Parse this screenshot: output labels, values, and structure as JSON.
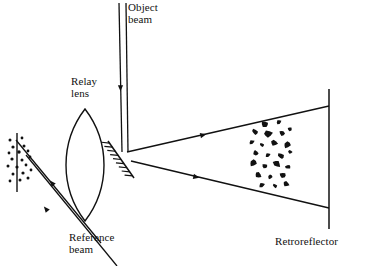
{
  "figure": {
    "kind": "optical-setup-diagram",
    "width": 371,
    "height": 266,
    "background_color": "#ffffff",
    "ink_color": "#111111"
  },
  "labels": {
    "object_beam": "Object\nbeam",
    "relay_lens": "Relay\nlens",
    "reference_beam": "Reference\nbeam",
    "retroreflector": "Retroreflector"
  },
  "components": {
    "object_beam": {
      "name": "object-beam",
      "description": "vertical collimated two-ray beam entering from top",
      "rays": [
        {
          "x1": 119,
          "y1": 3,
          "x2": 122,
          "y2": 152
        },
        {
          "x1": 126,
          "y1": 3,
          "x2": 128,
          "y2": 152
        }
      ],
      "direction_markers": [
        {
          "x": 120.5,
          "y": 88,
          "angle_deg": 90
        }
      ]
    },
    "relay_lens": {
      "name": "relay-lens",
      "description": "biconvex lens, vesica outline",
      "center_x": 85,
      "center_y": 165,
      "half_height": 56,
      "half_width": 19
    },
    "turning_mirror": {
      "name": "turning-mirror",
      "description": "hatched diagonal mirror at beam fold, hatching on lower-left face",
      "x1": 108,
      "y1": 141,
      "x2": 134,
      "y2": 178,
      "hatch_count": 9,
      "hatch_length": 8
    },
    "diverging_beam": {
      "name": "diverging-object-beam",
      "description": "beam expanding from mirror toward retroreflector",
      "upper_ray": {
        "x1": 127,
        "y1": 152,
        "x2": 329,
        "y2": 106
      },
      "lower_ray": {
        "x1": 131,
        "y1": 161,
        "x2": 329,
        "y2": 208
      },
      "direction_markers": [
        {
          "x": 203,
          "y": 135,
          "angle_deg": -13
        },
        {
          "x": 196,
          "y": 177,
          "angle_deg": 13
        }
      ]
    },
    "retroreflector": {
      "name": "retroreflector",
      "description": "vertical reflecting plane at right",
      "x": 329,
      "y_top": 89,
      "y_bottom": 229
    },
    "particle_cloud": {
      "name": "particle-cloud",
      "description": "irregular black scattering particles in the beam path",
      "particles": [
        {
          "cx": 265,
          "cy": 124,
          "rx": 4.0,
          "ry": 3.1,
          "rot": 20
        },
        {
          "cx": 279,
          "cy": 122,
          "rx": 2.6,
          "ry": 2.2,
          "rot": -30
        },
        {
          "cx": 255,
          "cy": 132,
          "rx": 3.4,
          "ry": 2.6,
          "rot": 40
        },
        {
          "cx": 268,
          "cy": 134,
          "rx": 4.4,
          "ry": 3.4,
          "rot": -15
        },
        {
          "cx": 282,
          "cy": 133,
          "rx": 3.0,
          "ry": 2.4,
          "rot": 55
        },
        {
          "cx": 290,
          "cy": 129,
          "rx": 2.4,
          "ry": 2.0,
          "rot": 0
        },
        {
          "cx": 252,
          "cy": 142,
          "rx": 2.8,
          "ry": 2.1,
          "rot": -25
        },
        {
          "cx": 262,
          "cy": 145,
          "rx": 2.3,
          "ry": 1.9,
          "rot": 30
        },
        {
          "cx": 274,
          "cy": 143,
          "rx": 3.6,
          "ry": 2.8,
          "rot": 10
        },
        {
          "cx": 287,
          "cy": 145,
          "rx": 3.8,
          "ry": 3.0,
          "rot": -40
        },
        {
          "cx": 256,
          "cy": 153,
          "rx": 3.2,
          "ry": 2.5,
          "rot": 50
        },
        {
          "cx": 268,
          "cy": 155,
          "rx": 2.6,
          "ry": 2.1,
          "rot": -20
        },
        {
          "cx": 281,
          "cy": 156,
          "rx": 3.4,
          "ry": 2.6,
          "rot": 25
        },
        {
          "cx": 290,
          "cy": 152,
          "rx": 2.2,
          "ry": 1.8,
          "rot": 0
        },
        {
          "cx": 253,
          "cy": 163,
          "rx": 3.8,
          "ry": 3.0,
          "rot": -35
        },
        {
          "cx": 265,
          "cy": 166,
          "rx": 3.0,
          "ry": 2.3,
          "rot": 15
        },
        {
          "cx": 277,
          "cy": 164,
          "rx": 4.2,
          "ry": 3.2,
          "rot": 45
        },
        {
          "cx": 288,
          "cy": 167,
          "rx": 2.8,
          "ry": 2.2,
          "rot": -10
        },
        {
          "cx": 258,
          "cy": 175,
          "rx": 3.4,
          "ry": 2.7,
          "rot": 30
        },
        {
          "cx": 270,
          "cy": 177,
          "rx": 2.5,
          "ry": 2.0,
          "rot": -45
        },
        {
          "cx": 283,
          "cy": 175,
          "rx": 3.6,
          "ry": 2.8,
          "rot": 5
        },
        {
          "cx": 262,
          "cy": 185,
          "rx": 3.0,
          "ry": 2.4,
          "rot": -20
        },
        {
          "cx": 275,
          "cy": 186,
          "rx": 2.4,
          "ry": 1.9,
          "rot": 35
        },
        {
          "cx": 286,
          "cy": 184,
          "rx": 3.2,
          "ry": 2.5,
          "rot": 20
        }
      ]
    },
    "detector_plane": {
      "name": "detector-plane",
      "description": "vertical recording plane at far left where beams combine",
      "x": 17,
      "y_top": 133,
      "y_bottom": 192
    },
    "speckle_dots": {
      "name": "speckle-pattern",
      "description": "small dots representing speckle at the recording plane",
      "dots": [
        {
          "cx": 10,
          "cy": 140,
          "r": 1.5
        },
        {
          "cx": 22,
          "cy": 138,
          "r": 1.4
        },
        {
          "cx": 13,
          "cy": 147,
          "r": 1.6
        },
        {
          "cx": 24,
          "cy": 146,
          "r": 1.5
        },
        {
          "cx": 9,
          "cy": 153,
          "r": 1.4
        },
        {
          "cx": 19,
          "cy": 152,
          "r": 1.7
        },
        {
          "cx": 28,
          "cy": 151,
          "r": 1.4
        },
        {
          "cx": 12,
          "cy": 159,
          "r": 1.6
        },
        {
          "cx": 22,
          "cy": 160,
          "r": 1.5
        },
        {
          "cx": 30,
          "cy": 157,
          "r": 1.4
        },
        {
          "cx": 8,
          "cy": 166,
          "r": 1.5
        },
        {
          "cx": 17,
          "cy": 167,
          "r": 1.6
        },
        {
          "cx": 26,
          "cy": 165,
          "r": 1.4
        },
        {
          "cx": 13,
          "cy": 174,
          "r": 1.5
        },
        {
          "cx": 23,
          "cy": 173,
          "r": 1.6
        },
        {
          "cx": 31,
          "cy": 170,
          "r": 1.4
        },
        {
          "cx": 10,
          "cy": 181,
          "r": 1.4
        },
        {
          "cx": 20,
          "cy": 180,
          "r": 1.5
        },
        {
          "cx": 28,
          "cy": 178,
          "r": 1.5
        }
      ]
    },
    "reference_beam": {
      "name": "reference-beam",
      "description": "two parallel diagonal rays travelling down-left to the recording plane",
      "rays": [
        {
          "x1": 101,
          "y1": 243,
          "x2": 16,
          "y2": 140
        },
        {
          "x1": 117,
          "y1": 266,
          "x2": 26,
          "y2": 155
        }
      ],
      "direction_markers": [
        {
          "x": 52,
          "y": 183,
          "angle_deg": 230
        },
        {
          "x": 46,
          "y": 209,
          "angle_deg": 230
        }
      ]
    }
  },
  "annotations": {
    "beam_path_order": [
      "object-beam",
      "relay-lens",
      "turning-mirror",
      "diverging-object-beam",
      "particle-cloud",
      "retroreflector",
      "detector-plane"
    ]
  }
}
